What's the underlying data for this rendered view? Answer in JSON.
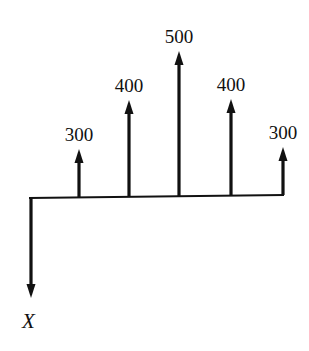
{
  "diagram": {
    "type": "cash-flow-diagram",
    "colors": {
      "ink": "#111111",
      "background": "#ffffff"
    },
    "baseline": {
      "x1": 29,
      "y1": 198,
      "x2": 284,
      "y2": 195
    },
    "outflow": {
      "label": "X",
      "x": 31,
      "y_start": 198,
      "y_end": 298
    },
    "inflows": [
      {
        "label": "300",
        "value": 300,
        "x": 79,
        "base_y": 197,
        "tip_y": 149
      },
      {
        "label": "400",
        "value": 400,
        "x": 129,
        "base_y": 197,
        "tip_y": 100
      },
      {
        "label": "500",
        "value": 500,
        "x": 179,
        "base_y": 196,
        "tip_y": 51
      },
      {
        "label": "400",
        "value": 400,
        "x": 231,
        "base_y": 196,
        "tip_y": 99
      },
      {
        "label": "300",
        "value": 300,
        "x": 283,
        "base_y": 195,
        "tip_y": 147
      }
    ]
  },
  "chart_data": {
    "type": "bar",
    "title": "",
    "categories": [
      "1",
      "2",
      "3",
      "4",
      "5"
    ],
    "values": [
      300,
      400,
      500,
      400,
      300
    ],
    "initial_outflow": "X",
    "xlabel": "",
    "ylabel": ""
  }
}
